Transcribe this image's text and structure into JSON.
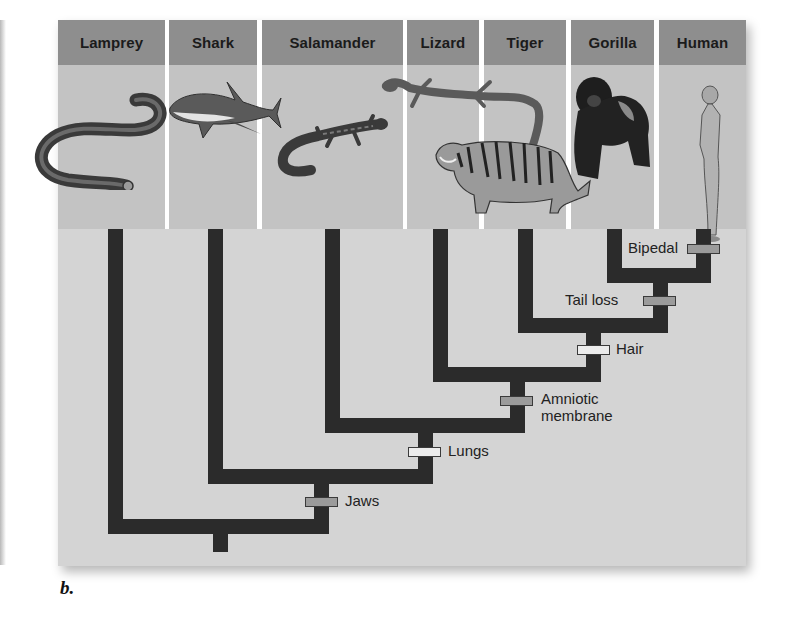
{
  "figure": {
    "label": "b.",
    "taxa": [
      {
        "name": "Lamprey"
      },
      {
        "name": "Shark"
      },
      {
        "name": "Salamander"
      },
      {
        "name": "Lizard"
      },
      {
        "name": "Tiger"
      },
      {
        "name": "Gorilla"
      },
      {
        "name": "Human"
      }
    ],
    "traits": [
      {
        "name": "Bipedal",
        "marker": "gray"
      },
      {
        "name": "Tail loss",
        "marker": "gray"
      },
      {
        "name": "Hair",
        "marker": "white"
      },
      {
        "name": "Amniotic membrane",
        "line1": "Amniotic",
        "line2": "membrane",
        "marker": "gray"
      },
      {
        "name": "Lungs",
        "marker": "white"
      },
      {
        "name": "Jaws",
        "marker": "gray"
      }
    ],
    "colors": {
      "header": "#8e8e8e",
      "image_area": "#c3c3c3",
      "tree_background": "#d4d4d4",
      "branch": "#2b2b2b",
      "marker_gray": "#9b9b9b",
      "marker_white": "#ececec"
    }
  }
}
